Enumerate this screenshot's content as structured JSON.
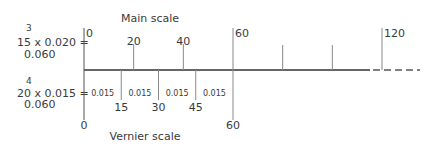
{
  "titles": {
    "main_scale": "Main scale",
    "vernier_scale": "Vernier scale"
  },
  "equations": {
    "main": {
      "superscript": "3",
      "expression": "15 x 0.020 =",
      "result": "0.060"
    },
    "vernier": {
      "superscript": "4",
      "expression": "20 x 0.015 =",
      "result": "0.060"
    }
  },
  "main_scale": {
    "ticks": [
      {
        "value": 0,
        "label": "0",
        "labeled": true
      },
      {
        "value": 20,
        "label": "20",
        "labeled": true
      },
      {
        "value": 40,
        "label": "40",
        "labeled": true
      },
      {
        "value": 60,
        "label": "60",
        "labeled": true
      },
      {
        "value": 80,
        "label": "",
        "labeled": false
      },
      {
        "value": 100,
        "label": "",
        "labeled": false
      },
      {
        "value": 120,
        "label": "120",
        "labeled": true
      }
    ],
    "continues": true
  },
  "vernier_scale": {
    "ticks": [
      {
        "value": 0,
        "label": "0"
      },
      {
        "value": 15,
        "label": "15"
      },
      {
        "value": 30,
        "label": "30"
      },
      {
        "value": 45,
        "label": "45"
      },
      {
        "value": 60,
        "label": "60"
      }
    ],
    "interval_label": "0.015"
  }
}
